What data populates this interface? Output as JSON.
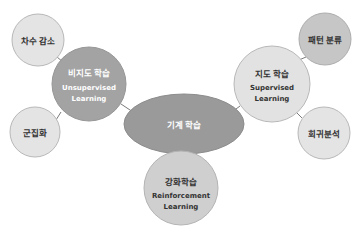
{
  "diagram": {
    "colors": {
      "background": "#ffffff",
      "edge": "#7a7a7a",
      "stroke": "#b8b8b8",
      "center_fill": "#9a9a9a",
      "unsupervised_fill": "#a3a3a3",
      "supervised_fill": "#e2e2e2",
      "reinforcement_fill": "#cfcfcf",
      "leaf_light_fill": "#e4e4e4",
      "leaf_medium_fill": "#c6c6c6",
      "dark_text": "#333333",
      "light_text": "#ffffff"
    },
    "center": {
      "label": "기계 학습"
    },
    "unsupervised": {
      "label_ko": "비지도 학습",
      "label_en_1": "Unsupervised",
      "label_en_2": "Learning"
    },
    "supervised": {
      "label_ko": "지도 학습",
      "label_en_1": "Supervised",
      "label_en_2": "Learning"
    },
    "reinforcement": {
      "label_ko": "강화학습",
      "label_en_1": "Reinforcement",
      "label_en_2": "Learning"
    },
    "leaves": {
      "dimension_reduction": "차수 감소",
      "clustering": "군집화",
      "pattern_classification": "패턴 분류",
      "regression": "회귀분석"
    }
  }
}
